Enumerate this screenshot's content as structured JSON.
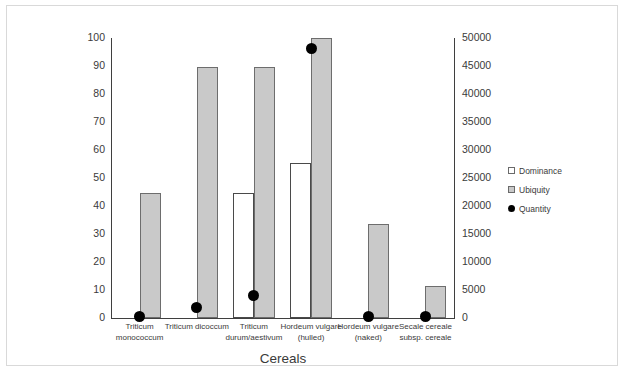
{
  "chart_data": {
    "type": "bar",
    "title": "",
    "xlabel": "Cereals",
    "ylabel": "",
    "categories": [
      "Triticum monococcum",
      "Triticum dicoccum",
      "Triticum durum/aestivum",
      "Hordeum vulgare (hulled)",
      "Hordeum vulgare (naked)",
      "Secale cereale subsp. cereale"
    ],
    "category_lines": [
      [
        "Triticum",
        "monococcum"
      ],
      [
        "Triticum dicoccum",
        ""
      ],
      [
        "Triticum",
        "durum/aestivum"
      ],
      [
        "Hordeum vulgare",
        "(hulled)"
      ],
      [
        "Hordeum vulgare",
        "(naked)"
      ],
      [
        "Secale cereale",
        "subsp. cereale"
      ]
    ],
    "series": [
      {
        "name": "Dominance",
        "axis": "left",
        "kind": "bar-outline",
        "values": [
          0,
          0,
          44.5,
          55.5,
          0,
          0
        ]
      },
      {
        "name": "Ubiquity",
        "axis": "left",
        "kind": "bar-filled",
        "values": [
          44.5,
          89.5,
          89.5,
          100,
          33.5,
          11.5
        ]
      },
      {
        "name": "Quantity",
        "axis": "right",
        "kind": "scatter",
        "values": [
          200,
          1800,
          4100,
          48200,
          300,
          200
        ]
      }
    ],
    "left_axis": {
      "min": 0,
      "max": 100,
      "step": 10,
      "ticks": [
        "0",
        "10",
        "20",
        "30",
        "40",
        "50",
        "60",
        "70",
        "80",
        "90",
        "100"
      ]
    },
    "right_axis": {
      "min": 0,
      "max": 50000,
      "step": 5000,
      "ticks": [
        "0",
        "5000",
        "10000",
        "15000",
        "20000",
        "25000",
        "30000",
        "35000",
        "40000",
        "45000",
        "50000"
      ]
    },
    "grid": false,
    "legend_position": "right",
    "legend": [
      {
        "label": "Dominance",
        "marker": "square-white",
        "color": "#ffffff"
      },
      {
        "label": "Ubiquity",
        "marker": "square-gray",
        "color": "#c9c9c9"
      },
      {
        "label": "Quantity",
        "marker": "circle-black",
        "color": "#000000"
      }
    ]
  }
}
